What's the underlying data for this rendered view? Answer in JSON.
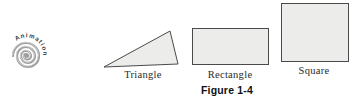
{
  "logo": {
    "label": "Animation",
    "icon": "spiral-icon"
  },
  "figure": {
    "caption": "Figure 1-4",
    "shapes": [
      {
        "type": "triangle",
        "label": "Triangle"
      },
      {
        "type": "rectangle",
        "label": "Rectangle"
      },
      {
        "type": "square",
        "label": "Square"
      }
    ]
  },
  "colors": {
    "background": "#ffffff",
    "shape_fill": "#ececea",
    "shape_stroke": "#4a4a4a",
    "label_text": "#2b2b2b",
    "caption_text": "#111111",
    "logo_spiral": "#9e9e9e",
    "logo_spiral_highlight": "#d2d2d2",
    "logo_text": "#3a3a3a"
  }
}
